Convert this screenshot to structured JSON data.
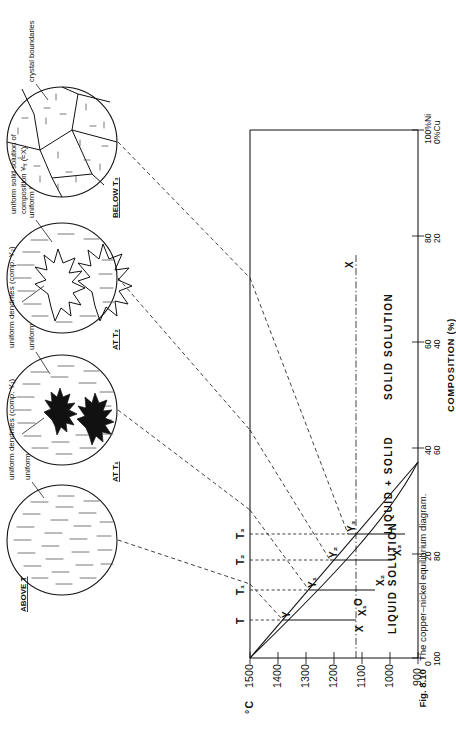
{
  "figure": {
    "number": "Fig. 8.10",
    "caption": "The copper–nickel equilibrium diagram."
  },
  "axes": {
    "y_axis_unit": "°C",
    "y_ticks": [
      "1500",
      "1400",
      "1300",
      "1200",
      "1100",
      "1000",
      "900"
    ],
    "x_axis_label": "COMPOSITION (%)",
    "x_ticks": [
      {
        "ni": "100",
        "cu": "0",
        "ni_suffix": "%Ni",
        "cu_suffix": "%Cu"
      },
      {
        "ni": "80",
        "cu": "20"
      },
      {
        "ni": "60",
        "cu": "40"
      },
      {
        "ni": "40",
        "cu": "60"
      },
      {
        "ni": "20",
        "cu": "80"
      },
      {
        "ni": "0",
        "cu": "100"
      }
    ],
    "composition_marker": "X"
  },
  "regions": [
    {
      "label": "LIQUID SOLUTION"
    },
    {
      "label": "LIQUID + SOLID"
    },
    {
      "label": "SOLID SOLUTION"
    }
  ],
  "temperature_labels": [
    "T",
    "T₁",
    "T₂",
    "T₃"
  ],
  "liquidus_points": [
    "X",
    "X₁",
    "X₂",
    "X₃"
  ],
  "solidus_points": [
    "Y",
    "Y₁",
    "Y₂",
    "Y₃"
  ],
  "origin_label": "O",
  "insets": [
    {
      "id": "inset-above-t",
      "heading": "ABOVE  T",
      "annotations": [
        "uniform  liquid (composition X )"
      ]
    },
    {
      "id": "inset-at-t1",
      "heading": "AT  T₁",
      "annotations": [
        "uniform dendrites (comp. Y₁)",
        "uniform liquid  (comp. X₁)"
      ]
    },
    {
      "id": "inset-at-t2",
      "heading": "AT  T₂",
      "annotations": [
        "uniform dendrites (comp. Y₂)",
        "uniform liquid  (comp. X₂)"
      ]
    },
    {
      "id": "inset-below-t3",
      "heading": "BELOW  T₃",
      "annotations": [
        "uniform solid solution of",
        "composition Y₃ (=X)",
        "crystal boundaries"
      ]
    }
  ],
  "colors": {
    "ink": "#111111",
    "paper": "#ffffff",
    "hatch": "#555555"
  }
}
